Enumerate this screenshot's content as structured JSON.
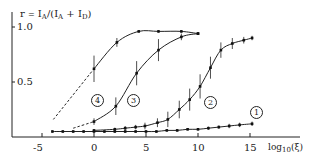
{
  "chart_data": {
    "type": "line",
    "title": "",
    "ylabel": "r = I_A/(I_A + I_D)",
    "xlabel": "log10(ξ)",
    "xlim": [
      -6,
      17
    ],
    "ylim": [
      0,
      1.05
    ],
    "x_ticks": [
      -5,
      0,
      5,
      10,
      15
    ],
    "x_tick_labels": [
      "-5",
      "0",
      "5",
      "10",
      "15"
    ],
    "y_ticks": [
      0.5,
      1.0
    ],
    "y_tick_labels": [
      "0.5",
      "1.0"
    ],
    "grid": false,
    "legend": "none (curves labeled inline with circled numbers)",
    "series": [
      {
        "name": "1",
        "style": "solid",
        "x": [
          -4,
          -3,
          -2,
          -1,
          0,
          1,
          2,
          3,
          4,
          5,
          6,
          7,
          8,
          9,
          10,
          11,
          12,
          13,
          14,
          15.2
        ],
        "y": [
          0.05,
          0.05,
          0.05,
          0.05,
          0.05,
          0.05,
          0.05,
          0.05,
          0.05,
          0.05,
          0.05,
          0.06,
          0.06,
          0.07,
          0.07,
          0.08,
          0.09,
          0.1,
          0.11,
          0.12
        ],
        "error": [
          0.01,
          0.01,
          0.01,
          0.01,
          0.01,
          0.01,
          0.01,
          0.01,
          0.01,
          0.01,
          0.01,
          0.01,
          0.01,
          0.01,
          0.01,
          0.015,
          0.015,
          0.02,
          0.02,
          0.02
        ]
      },
      {
        "name": "2",
        "style": "solid",
        "x": [
          0,
          2,
          3,
          4,
          4.9,
          6.1,
          7.1,
          8.2,
          9.2,
          10.2,
          11.2,
          12.2,
          13.3,
          14.4,
          15.2
        ],
        "y": [
          0.06,
          0.07,
          0.08,
          0.09,
          0.1,
          0.13,
          0.16,
          0.25,
          0.34,
          0.46,
          0.63,
          0.79,
          0.85,
          0.88,
          0.9
        ],
        "error": [
          0.01,
          0.015,
          0.02,
          0.02,
          0.03,
          0.04,
          0.07,
          0.08,
          0.1,
          0.11,
          0.1,
          0.07,
          0.05,
          0.03,
          0.02
        ]
      },
      {
        "name": "3",
        "style": "dashed below x=0, solid above",
        "x": [
          -2,
          0,
          2.1,
          4.1,
          6.2,
          8.4,
          10
        ],
        "y": [
          0.08,
          0.14,
          0.28,
          0.58,
          0.79,
          0.91,
          0.94
        ],
        "error": [
          0,
          0.03,
          0.08,
          0.11,
          0.1,
          0.03,
          0.01
        ]
      },
      {
        "name": "4",
        "style": "dashed below x=0, solid above",
        "x": [
          -3.9,
          0,
          2.2,
          4.3,
          6.2,
          8.4,
          10
        ],
        "y": [
          0.16,
          0.62,
          0.86,
          0.96,
          0.96,
          0.96,
          0.94
        ],
        "error": [
          0,
          0.12,
          0.04,
          0.01,
          0.01,
          0.01,
          0.01
        ]
      }
    ],
    "annotations": [
      {
        "text": "1",
        "x": 15.5,
        "y": 0.22
      },
      {
        "text": "2",
        "x": 11.1,
        "y": 0.32
      },
      {
        "text": "3",
        "x": 3.7,
        "y": 0.35
      },
      {
        "text": "4",
        "x": 0.3,
        "y": 0.35
      }
    ]
  },
  "labels": {
    "ylabel_r": "r",
    "ylabel_eq": "=",
    "ylabel_ia": "I",
    "ylabel_ia_sub": "A",
    "ylabel_slash": "/(",
    "ylabel_ia2": "I",
    "ylabel_ia2_sub": "A",
    "ylabel_plus": " + ",
    "ylabel_id": "I",
    "ylabel_id_sub": "D",
    "ylabel_close": ")",
    "xlabel_log": "log",
    "xlabel_sub": "10",
    "xlabel_arg": "(ξ)",
    "ytick_1": "1.0",
    "ytick_05": "0.5",
    "xtick_m5": "-5",
    "xtick_0": "0",
    "xtick_5": "5",
    "xtick_10": "10",
    "xtick_15": "15",
    "curve_1": "1",
    "curve_2": "2",
    "curve_3": "3",
    "curve_4": "4"
  }
}
